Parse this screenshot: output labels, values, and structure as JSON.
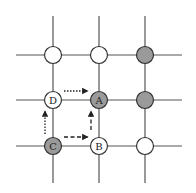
{
  "diagram": {
    "type": "lattice-grid",
    "grid": {
      "cols": 3,
      "rows": 3,
      "line_color": "#555555"
    },
    "colors": {
      "filled": "#9a9a9a",
      "empty": "#ffffff",
      "stroke": "#333333",
      "arrow": "#222222"
    },
    "nodes": [
      {
        "row": 0,
        "col": 0,
        "filled": false,
        "label": ""
      },
      {
        "row": 0,
        "col": 1,
        "filled": false,
        "label": ""
      },
      {
        "row": 0,
        "col": 2,
        "filled": true,
        "label": ""
      },
      {
        "row": 1,
        "col": 0,
        "filled": false,
        "label": "D"
      },
      {
        "row": 1,
        "col": 1,
        "filled": true,
        "label": "A"
      },
      {
        "row": 1,
        "col": 2,
        "filled": true,
        "label": ""
      },
      {
        "row": 2,
        "col": 0,
        "filled": true,
        "label": "C"
      },
      {
        "row": 2,
        "col": 1,
        "filled": false,
        "label": "B"
      },
      {
        "row": 2,
        "col": 2,
        "filled": false,
        "label": ""
      }
    ],
    "arrows": [
      {
        "from": "D",
        "to": "A",
        "style": "dotted"
      },
      {
        "from": "C",
        "to": "D",
        "style": "dotted"
      },
      {
        "from": "C",
        "to": "B",
        "style": "dashed"
      },
      {
        "from": "B",
        "to": "A",
        "style": "dashed"
      }
    ]
  }
}
